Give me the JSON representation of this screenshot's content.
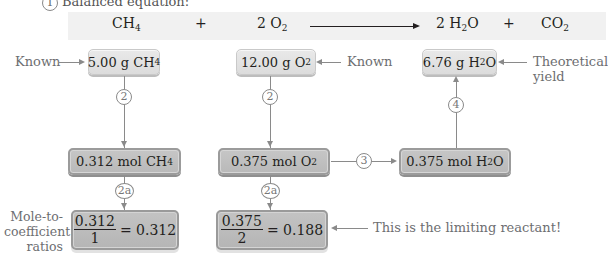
{
  "step1": {
    "number": "1",
    "label": "Balanced equation:"
  },
  "equation": {
    "reactant1": {
      "coef": "",
      "formula": "CH",
      "sub": "4"
    },
    "plus1": "+",
    "reactant2": {
      "coef": "2 ",
      "formula": "O",
      "sub": "2"
    },
    "product1": {
      "coef": "2 ",
      "formula_a": "H",
      "sub": "2",
      "formula_b": "O"
    },
    "plus2": "+",
    "product2": {
      "formula": "CO",
      "sub": "2"
    }
  },
  "col_ch4": {
    "known_label": "Known",
    "mass_box": {
      "text": "5.00 g CH",
      "sub": "4"
    },
    "step_circle_1": "2",
    "mol_box": {
      "text": "0.312 mol CH",
      "sub": "4"
    },
    "step_circle_2": "2a",
    "ratio_box": {
      "numerator": "0.312",
      "denominator": "1",
      "result": "= 0.312"
    },
    "ratio_label": [
      "Mole-to-",
      "coefficient",
      "ratios"
    ]
  },
  "col_o2": {
    "known_label": "Known",
    "mass_box": {
      "text": "12.00 g O",
      "sub": "2"
    },
    "step_circle_1": "2",
    "mol_box": {
      "text": "0.375 mol O",
      "sub": "2"
    },
    "step_circle_2": "2a",
    "ratio_box": {
      "numerator": "0.375",
      "denominator": "2",
      "result": "= 0.188"
    },
    "limiting_label": "This is the limiting reactant!"
  },
  "col_h2o": {
    "step_circle_3": "3",
    "mol_box": {
      "text_a": "0.375 mol H",
      "sub": "2",
      "text_b": "O"
    },
    "step_circle_4": "4",
    "mass_box": {
      "text_a": "6.76 g H",
      "sub": "2",
      "text_b": "O"
    },
    "yield_label": [
      "Theoretical",
      "yield"
    ]
  },
  "colors": {
    "equation_bar": "#f1f1f1",
    "light_box": "#e0e0e0",
    "dark_box": "#bdbdbd",
    "line": "#8a8a8a",
    "note_text": "#6d6e71"
  }
}
